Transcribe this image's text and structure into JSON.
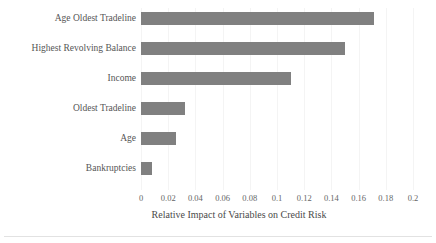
{
  "chart_data": {
    "type": "bar",
    "orientation": "horizontal",
    "title": "",
    "subtitle": "",
    "xlabel": "Relative Impact of Variables on Credit Risk",
    "ylabel": "",
    "categories": [
      "Age Oldest Tradeline",
      "Highest Revolving Balance",
      "Income",
      "Oldest Tradeline",
      "Age",
      "Bankruptcies"
    ],
    "values": [
      0.171,
      0.15,
      0.11,
      0.032,
      0.026,
      0.008
    ],
    "xlim": [
      0,
      0.2
    ],
    "xticks": [
      0,
      0.02,
      0.04,
      0.06,
      0.08,
      0.1,
      0.12,
      0.14,
      0.16,
      0.18,
      0.2
    ],
    "xtick_labels": [
      "0",
      "0.02",
      "0.04",
      "0.06",
      "0.08",
      "0.1",
      "0.12",
      "0.14",
      "0.16",
      "0.18",
      "0.2"
    ],
    "grid": "vertical-light",
    "legend": "none",
    "bar_color": "#808080",
    "gridline_color": "#f4f4f4",
    "text_color": "#4a4a4a",
    "background_color": "#ffffff"
  }
}
